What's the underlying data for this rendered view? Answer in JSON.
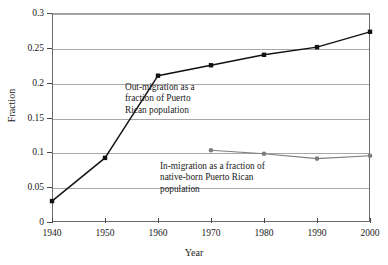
{
  "chart_data": {
    "type": "line",
    "title": "",
    "xlabel": "Year",
    "ylabel": "Fraction",
    "x": [
      1940,
      1950,
      1960,
      1970,
      1980,
      1990,
      2000
    ],
    "xlim": [
      1940,
      2000
    ],
    "ylim": [
      0,
      0.3
    ],
    "xticks": [
      "1940",
      "1950",
      "1960",
      "1970",
      "1980",
      "1990",
      "2000"
    ],
    "yticks": [
      "0",
      "0.05",
      "0.1",
      "0.15",
      "0.2",
      "0.25",
      "0.3"
    ],
    "ytick_values": [
      0,
      0.05,
      0.1,
      0.15,
      0.2,
      0.25,
      0.3
    ],
    "grid": true,
    "legend_position": "inline-annotations",
    "series": [
      {
        "name": "Out-migration as a fraction of Puerto Rican population",
        "color": "#111111",
        "marker": "square",
        "x": [
          1940,
          1950,
          1960,
          1970,
          1980,
          1990,
          2000
        ],
        "values": [
          0.03,
          0.092,
          0.21,
          0.225,
          0.24,
          0.251,
          0.273
        ]
      },
      {
        "name": "In-migration as a fraction of native-born Puerto Rican population",
        "color": "#7d7d7d",
        "marker": "circle",
        "x": [
          1970,
          1980,
          1990,
          2000
        ],
        "values": [
          0.103,
          0.098,
          0.091,
          0.095
        ]
      }
    ],
    "annotations": [
      {
        "id": "out-migration",
        "text": "Out-migration as a\nfraction of Puerto\nRican population"
      },
      {
        "id": "in-migration",
        "text": "In-migration as a fraction of\nnative-born Puerto Rican\npopulation"
      }
    ]
  }
}
